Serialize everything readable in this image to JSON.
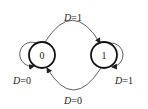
{
  "diagram": {
    "type": "state-transition",
    "states": [
      {
        "id": "s0",
        "label": "0",
        "cx": 42,
        "cy": 55,
        "r": 13
      },
      {
        "id": "s1",
        "label": "1",
        "cx": 104,
        "cy": 55,
        "r": 13
      }
    ],
    "transitions": [
      {
        "from": "0",
        "to": "1",
        "var": "D",
        "eq": "=1",
        "text": "D=1"
      },
      {
        "from": "1",
        "to": "0",
        "var": "D",
        "eq": "=0",
        "text": "D=0"
      },
      {
        "from": "0",
        "to": "0",
        "var": "D",
        "eq": "=0",
        "text": "D=0"
      },
      {
        "from": "1",
        "to": "1",
        "var": "D",
        "eq": "=1",
        "text": "D=1"
      }
    ],
    "colors": {
      "stroke": "#222222",
      "background": "#ffffff"
    }
  }
}
